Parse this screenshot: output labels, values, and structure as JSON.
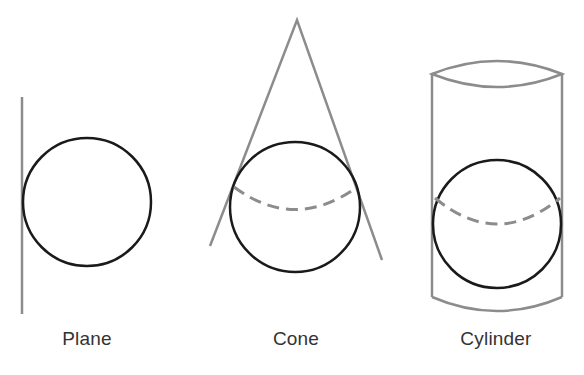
{
  "figure": {
    "panels": [
      {
        "id": "plane",
        "label": "Plane",
        "label_x": 87
      },
      {
        "id": "cone",
        "label": "Cone",
        "label_x": 296
      },
      {
        "id": "cylinder",
        "label": "Cylinder",
        "label_x": 496
      }
    ],
    "colors": {
      "sphere": "#1a1a1a",
      "surface": "#8c8c8c",
      "tangent_line": "#8c8c8c"
    }
  }
}
